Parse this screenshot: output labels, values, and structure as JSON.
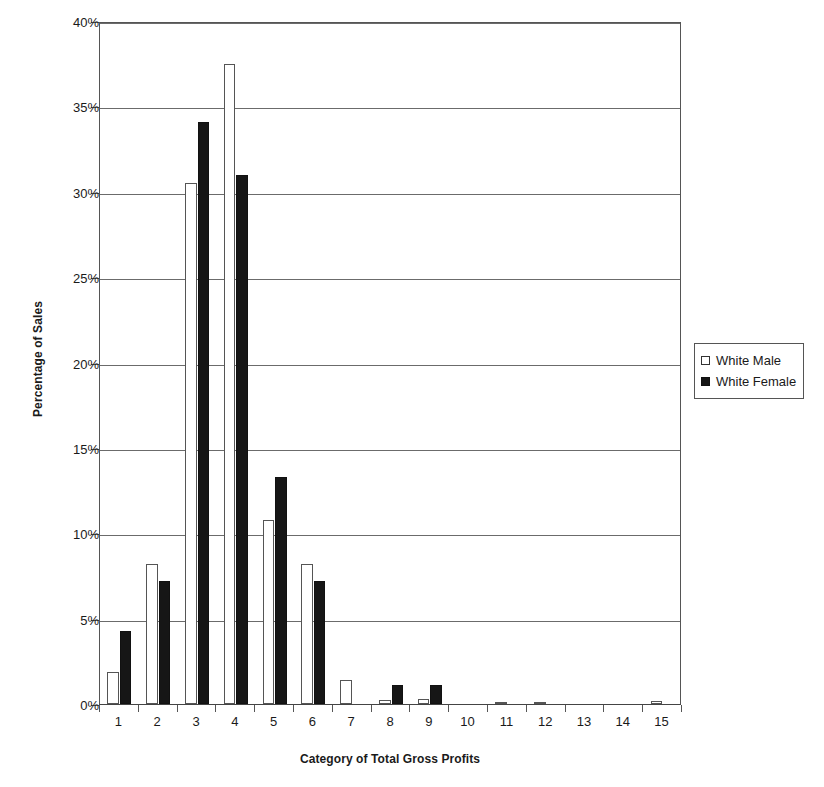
{
  "chart_data": {
    "type": "bar",
    "title": "",
    "xlabel": "Category of Total Gross Profits",
    "ylabel": "Percentage of Sales",
    "categories": [
      "1",
      "2",
      "3",
      "4",
      "5",
      "6",
      "7",
      "8",
      "9",
      "10",
      "11",
      "12",
      "13",
      "14",
      "15"
    ],
    "series": [
      {
        "name": "White Male",
        "color": "#ffffff",
        "values": [
          1.9,
          8.2,
          30.5,
          37.5,
          10.8,
          8.2,
          1.4,
          0.25,
          0.3,
          0.0,
          0.05,
          0.05,
          0.0,
          0.0,
          0.2
        ]
      },
      {
        "name": "White Female",
        "color": "#161616",
        "values": [
          4.3,
          7.2,
          34.1,
          31.0,
          13.3,
          7.2,
          0.0,
          1.1,
          1.1,
          0.0,
          0.0,
          0.0,
          0.0,
          0.0,
          0.0
        ]
      }
    ],
    "ylim": [
      0,
      40
    ],
    "ytick_values": [
      0,
      5,
      10,
      15,
      20,
      25,
      30,
      35,
      40
    ],
    "ytick_labels": [
      "0%",
      "5%",
      "10%",
      "15%",
      "20%",
      "25%",
      "30%",
      "35%",
      "40%"
    ],
    "grid": "horizontal",
    "legend_position": "right",
    "value_suffix": "%"
  },
  "legend": {
    "entries": [
      {
        "label": "White Male",
        "swatch": "hollow-square-swatch"
      },
      {
        "label": "White Female",
        "swatch": "filled-square-swatch"
      }
    ]
  }
}
